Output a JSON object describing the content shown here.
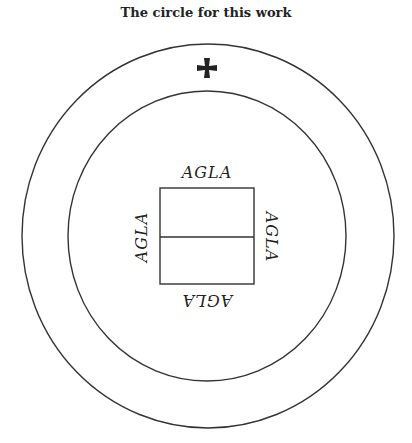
{
  "title": "The circle for this work",
  "diagram": {
    "outer_circle": {
      "cx": 208,
      "cy": 236,
      "rx": 186,
      "ry": 192
    },
    "inner_circle": {
      "cx": 207,
      "cy": 236,
      "rx": 139,
      "ry": 145
    },
    "cross_symbol": "cross-pattee",
    "square": {
      "x": 160,
      "y": 188,
      "width": 94,
      "height": 96,
      "divider": "horizontal"
    },
    "labels": {
      "top": "AGLA",
      "left": "AGLA",
      "right": "AGLA",
      "bottom": "AGLA"
    },
    "stroke_color": "#333333"
  }
}
